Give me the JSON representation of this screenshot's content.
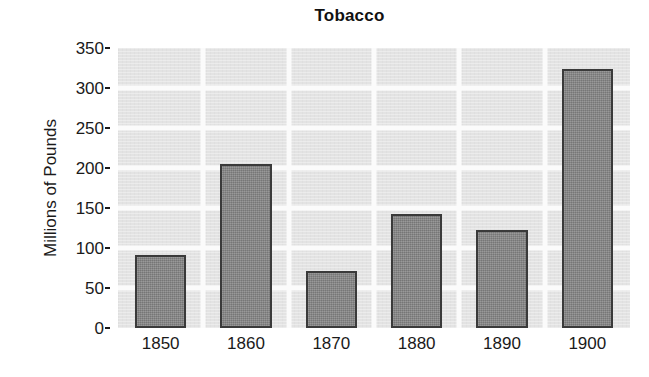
{
  "chart_data": {
    "type": "bar",
    "title": "Tobacco",
    "xlabel": "",
    "ylabel": "Millions of Pounds",
    "categories": [
      "1850",
      "1860",
      "1870",
      "1880",
      "1890",
      "1900"
    ],
    "values": [
      91,
      205,
      71,
      142,
      122,
      324
    ],
    "ylim": [
      0,
      350
    ],
    "yticks": [
      0,
      50,
      100,
      150,
      200,
      250,
      300,
      350
    ],
    "ytick_labels": [
      "0",
      "50",
      "100",
      "150",
      "200",
      "250",
      "300",
      "350"
    ],
    "grid": true,
    "legend": null,
    "bar_color": "#828282",
    "bar_edge_color": "#3a3a3a",
    "panel_color": "#e3e3e3",
    "grid_color": "#fbfbfb"
  }
}
